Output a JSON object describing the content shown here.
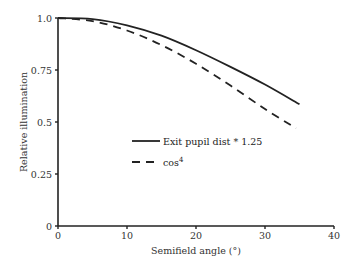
{
  "chart_data": {
    "type": "line",
    "title": "",
    "xlabel": "Semifield angle (°)",
    "ylabel": "Relative illumination",
    "xlim": [
      0,
      40
    ],
    "ylim": [
      0,
      1.0
    ],
    "xticks": [
      0,
      10,
      20,
      30,
      40
    ],
    "yticks": [
      0,
      0.25,
      0.5,
      0.75,
      1.0
    ],
    "xtick_labels": [
      "0",
      "10",
      "20",
      "30",
      "40"
    ],
    "ytick_labels": [
      "0",
      "0.25",
      "0.5",
      "0.75",
      "1.0"
    ],
    "grid": false,
    "legend_position": "center-left inside plot",
    "series": [
      {
        "name": "Exit pupil dist * 1.25",
        "style": "solid",
        "x": [
          0,
          5,
          10,
          15,
          20,
          25,
          30,
          35
        ],
        "y": [
          1.0,
          0.995,
          0.965,
          0.915,
          0.845,
          0.765,
          0.68,
          0.585
        ]
      },
      {
        "name": "cos4",
        "style": "dashed",
        "x": [
          0,
          5,
          10,
          15,
          20,
          25,
          30,
          34.5
        ],
        "y": [
          1.0,
          0.985,
          0.94,
          0.87,
          0.78,
          0.675,
          0.5625,
          0.47
        ]
      }
    ]
  },
  "legend": {
    "items": [
      {
        "label": "Exit pupil dist * 1.25",
        "style": "solid"
      },
      {
        "label": "cos",
        "superscript": "4",
        "style": "dashed"
      }
    ]
  },
  "axes": {
    "xlabel": "Semifield angle (°)",
    "ylabel": "Relative illumination"
  }
}
